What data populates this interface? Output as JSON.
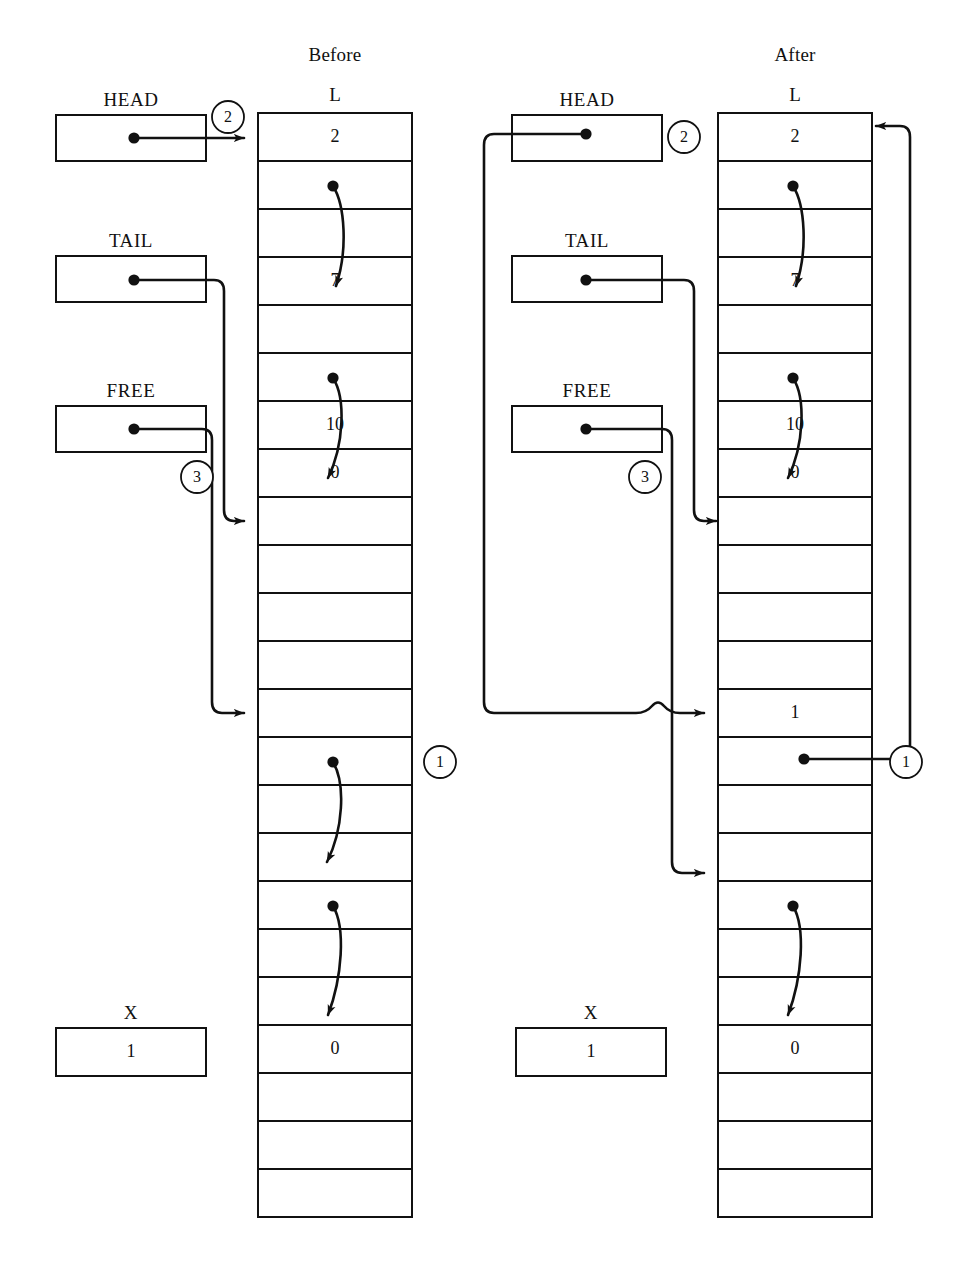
{
  "figure": {
    "caption_before": "Before",
    "caption_after": "After",
    "array_label": "L"
  },
  "geometry": {
    "cell_height": 48,
    "cell_count": 23,
    "before": {
      "array_x": 258,
      "array_w": 154,
      "array_y": 113
    },
    "after": {
      "array_x": 718,
      "array_w": 154,
      "array_y": 113
    }
  },
  "before": {
    "pointers": [
      {
        "name": "HEAD",
        "label": "HEAD",
        "box_x": 56,
        "box_y": 115,
        "box_w": 150,
        "box_h": 46,
        "dot_x": 134,
        "dot_y": 138
      },
      {
        "name": "TAIL",
        "label": "TAIL",
        "box_x": 56,
        "box_y": 256,
        "box_w": 150,
        "box_h": 46,
        "dot_x": 134,
        "dot_y": 280
      },
      {
        "name": "FREE",
        "label": "FREE",
        "box_x": 56,
        "box_y": 406,
        "box_w": 150,
        "box_h": 46,
        "dot_x": 134,
        "dot_y": 429
      }
    ],
    "variable": {
      "name": "X",
      "label": "X",
      "value": "1",
      "box_x": 56,
      "box_y": 1028,
      "box_w": 150,
      "box_h": 48
    },
    "cells": [
      {
        "index": 0,
        "text": "2"
      },
      {
        "index": 1,
        "text": ""
      },
      {
        "index": 2,
        "text": ""
      },
      {
        "index": 3,
        "text": "7"
      },
      {
        "index": 4,
        "text": ""
      },
      {
        "index": 5,
        "text": ""
      },
      {
        "index": 6,
        "text": "10"
      },
      {
        "index": 7,
        "text": "0"
      },
      {
        "index": 8,
        "text": ""
      },
      {
        "index": 9,
        "text": ""
      },
      {
        "index": 10,
        "text": ""
      },
      {
        "index": 11,
        "text": ""
      },
      {
        "index": 12,
        "text": ""
      },
      {
        "index": 13,
        "text": ""
      },
      {
        "index": 14,
        "text": ""
      },
      {
        "index": 15,
        "text": ""
      },
      {
        "index": 16,
        "text": ""
      },
      {
        "index": 17,
        "text": ""
      },
      {
        "index": 18,
        "text": ""
      },
      {
        "index": 19,
        "text": "0"
      },
      {
        "index": 20,
        "text": ""
      },
      {
        "index": 21,
        "text": ""
      },
      {
        "index": 22,
        "text": ""
      }
    ],
    "step_markers": [
      {
        "label": "2",
        "cx": 228,
        "cy": 117,
        "r": 16
      },
      {
        "label": "3",
        "cx": 197,
        "cy": 477,
        "r": 16
      },
      {
        "label": "1",
        "cx": 440,
        "cy": 762,
        "r": 16
      }
    ]
  },
  "after": {
    "pointers": [
      {
        "name": "HEAD",
        "label": "HEAD",
        "box_x": 512,
        "box_y": 115,
        "box_w": 150,
        "box_h": 46,
        "dot_x": 586,
        "dot_y": 134
      },
      {
        "name": "TAIL",
        "label": "TAIL",
        "box_x": 512,
        "box_y": 256,
        "box_w": 150,
        "box_h": 46,
        "dot_x": 586,
        "dot_y": 280
      },
      {
        "name": "FREE",
        "label": "FREE",
        "box_x": 512,
        "box_y": 406,
        "box_w": 150,
        "box_h": 46,
        "dot_x": 586,
        "dot_y": 429
      }
    ],
    "variable": {
      "name": "X",
      "label": "X",
      "value": "1",
      "box_x": 516,
      "box_y": 1028,
      "box_w": 150,
      "box_h": 48
    },
    "cells": [
      {
        "index": 0,
        "text": "2"
      },
      {
        "index": 1,
        "text": ""
      },
      {
        "index": 2,
        "text": ""
      },
      {
        "index": 3,
        "text": "7"
      },
      {
        "index": 4,
        "text": ""
      },
      {
        "index": 5,
        "text": ""
      },
      {
        "index": 6,
        "text": "10"
      },
      {
        "index": 7,
        "text": "0"
      },
      {
        "index": 8,
        "text": ""
      },
      {
        "index": 9,
        "text": ""
      },
      {
        "index": 10,
        "text": ""
      },
      {
        "index": 11,
        "text": ""
      },
      {
        "index": 12,
        "text": "1"
      },
      {
        "index": 13,
        "text": ""
      },
      {
        "index": 14,
        "text": ""
      },
      {
        "index": 15,
        "text": ""
      },
      {
        "index": 16,
        "text": ""
      },
      {
        "index": 17,
        "text": ""
      },
      {
        "index": 18,
        "text": ""
      },
      {
        "index": 19,
        "text": "0"
      },
      {
        "index": 20,
        "text": ""
      },
      {
        "index": 21,
        "text": ""
      },
      {
        "index": 22,
        "text": ""
      }
    ],
    "step_markers": [
      {
        "label": "2",
        "cx": 684,
        "cy": 137,
        "r": 16
      },
      {
        "label": "3",
        "cx": 645,
        "cy": 477,
        "r": 16
      },
      {
        "label": "1",
        "cx": 906,
        "cy": 762,
        "r": 16
      }
    ]
  },
  "colors": {
    "ink": "#111111",
    "paper": "#ffffff",
    "rule": "#111111"
  }
}
